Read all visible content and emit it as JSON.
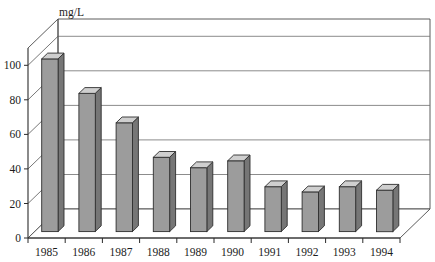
{
  "chart_data": {
    "type": "bar",
    "title": "",
    "unit_label": "mg/L",
    "xlabel": "",
    "ylabel": "mg/L",
    "categories": [
      "1985",
      "1986",
      "1987",
      "1988",
      "1989",
      "1990",
      "1991",
      "1992",
      "1993",
      "1994"
    ],
    "values": [
      100,
      80,
      63,
      43,
      37,
      41,
      26,
      23,
      26,
      24
    ],
    "ylim": [
      0,
      110
    ],
    "yticks": [
      0,
      20,
      40,
      60,
      80,
      100
    ],
    "ytick_labels": [
      "0",
      "20",
      "40",
      "60",
      "80",
      "100"
    ],
    "grid": true,
    "legend": "none",
    "style": "3d-columns",
    "series": [
      {
        "name": "concentration",
        "values": [
          100,
          80,
          63,
          43,
          37,
          41,
          26,
          23,
          26,
          24
        ]
      }
    ]
  },
  "colors": {
    "bar_front": "#9c9c9c",
    "bar_side": "#767676",
    "bar_top": "#cfcfcf",
    "background": "#ffffff",
    "gridline": "#6e6e6e",
    "axis": "#2b2b2b",
    "text": "#1c1c1c"
  }
}
